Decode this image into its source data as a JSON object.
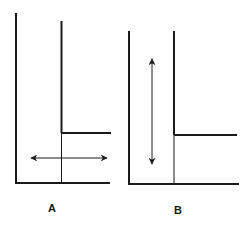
{
  "diagram": {
    "type": "two-panel flow/channel schematic",
    "colors": {
      "line": "#1a1a1a",
      "background": "#ffffff"
    },
    "panels": [
      {
        "id": "A",
        "label": "A",
        "arrow_direction": "horizontal (double-headed)",
        "description": "L-shaped channel with a step; double-headed horizontal arrow in the lower passage"
      },
      {
        "id": "B",
        "label": "B",
        "arrow_direction": "vertical (double-headed)",
        "description": "L-shaped channel with a step; double-headed vertical arrow in the tall passage"
      }
    ]
  }
}
